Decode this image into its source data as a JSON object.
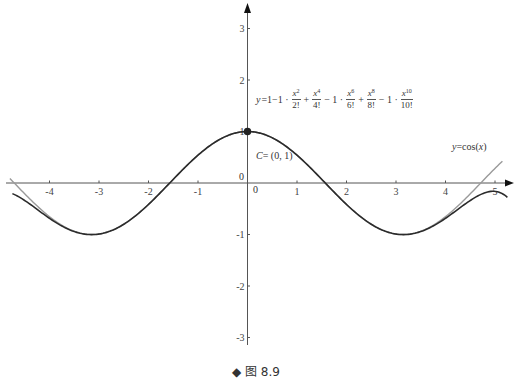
{
  "chart_data": {
    "type": "line",
    "title": "",
    "caption": "◆ 图 8.9",
    "xlabel": "",
    "ylabel": "",
    "xlim": [
      -4.8,
      5.3
    ],
    "ylim": [
      -3.3,
      3.5
    ],
    "x_ticks": [
      -4,
      -3,
      -2,
      -1,
      0,
      1,
      2,
      3,
      4,
      5
    ],
    "x_tick_labels": [
      "-4",
      "-3",
      "-2",
      "-1",
      "0",
      "1",
      "2",
      "3",
      "4",
      "5"
    ],
    "y_ticks": [
      -3,
      -2,
      -1,
      0,
      1,
      2,
      3
    ],
    "y_tick_labels": [
      "-3",
      "-2",
      "-1",
      "0",
      "1",
      "2",
      "3"
    ],
    "grid": false,
    "legend": "none (curves labeled inline)",
    "series": [
      {
        "name": "y = cos(x)",
        "color": "#9a9a9a",
        "function": "cos(x)",
        "x_range": [
          -4.8,
          5.15
        ],
        "sample_points": [
          [
            -4.8,
            0.09
          ],
          [
            -4,
            -0.65
          ],
          [
            -3.14,
            -1
          ],
          [
            -2,
            -0.42
          ],
          [
            -1,
            0.54
          ],
          [
            0,
            1
          ],
          [
            1,
            0.54
          ],
          [
            2,
            -0.42
          ],
          [
            3.14,
            -1
          ],
          [
            4,
            -0.65
          ],
          [
            5,
            0.28
          ],
          [
            5.15,
            0.42
          ]
        ]
      },
      {
        "name": "Taylor polynomial degree 10",
        "color": "#2b2b2b",
        "function": "1 - x^2/2! + x^4/4! - x^6/6! + x^8/8! - x^10/10!",
        "x_range": [
          -4.75,
          5.25
        ],
        "sample_points": [
          [
            -4.75,
            -0.19
          ],
          [
            -4,
            -0.67
          ],
          [
            -3.14,
            -1
          ],
          [
            -2,
            -0.42
          ],
          [
            -1,
            0.54
          ],
          [
            0,
            1
          ],
          [
            1,
            0.54
          ],
          [
            2,
            -0.42
          ],
          [
            3.14,
            -1
          ],
          [
            4,
            -0.67
          ],
          [
            5,
            -0.16
          ],
          [
            5.25,
            -0.3
          ]
        ]
      }
    ],
    "annotations": [
      {
        "text": "y=cos(x)",
        "x": 4.2,
        "y": 0.65
      },
      {
        "text": "C= (0, 1)",
        "x": 0.1,
        "y": 0.45,
        "point": [
          0,
          1
        ]
      },
      {
        "text": "y=1−1·x²/2!+x⁴/4!−1·x⁶/6!+x⁸/8!−1·x¹⁰/10!",
        "x": 0.2,
        "y": 1.6
      }
    ]
  },
  "labels": {
    "cos_label_y": "y",
    "cos_label_rest": "=cos(",
    "cos_label_x": "x",
    "cos_label_close": ")",
    "point_c_name": "C",
    "point_c_rest": "= (0, 1)",
    "origin_left": "0",
    "origin_right": "0",
    "caption": "◆ 图 8.9",
    "formula": {
      "lhs_var": "y",
      "lhs_rest": "=1−1 ·",
      "t1_num": "x",
      "t1_exp": "2",
      "t1_den": "2!",
      "op1": "+",
      "t2_num": "x",
      "t2_exp": "4",
      "t2_den": "4!",
      "op2": "− 1 ·",
      "t3_num": "x",
      "t3_exp": "6",
      "t3_den": "6!",
      "op3": "+",
      "t4_num": "x",
      "t4_exp": "8",
      "t4_den": "8!",
      "op4": "− 1 ·",
      "t5_num": "x",
      "t5_exp": "10",
      "t5_den": "10!"
    }
  }
}
